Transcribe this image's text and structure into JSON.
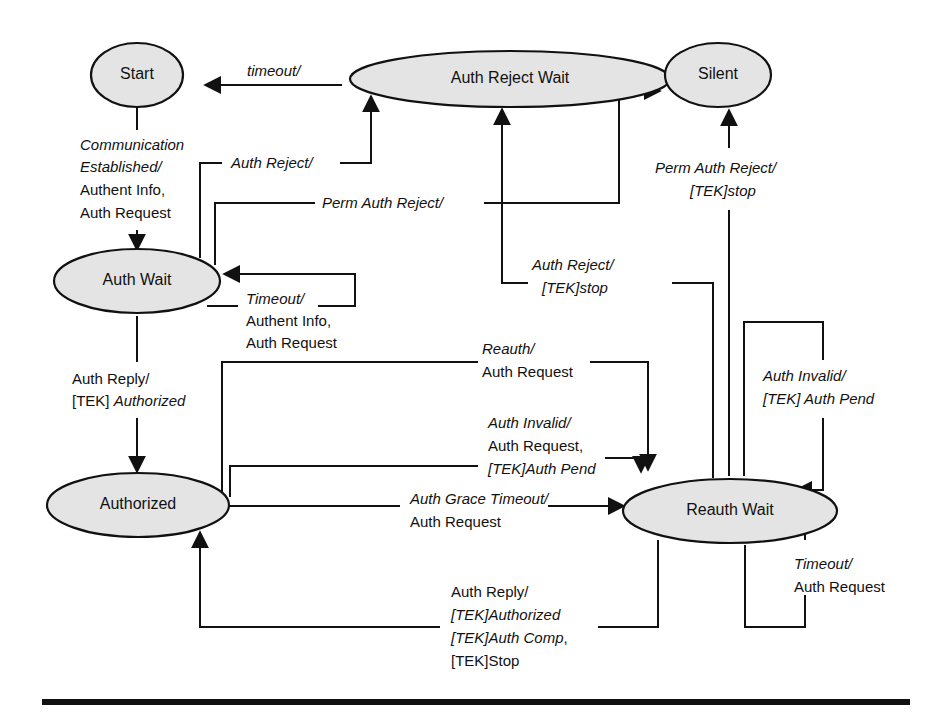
{
  "states": {
    "start": "Start",
    "auth_reject_wait": "Auth Reject Wait",
    "silent": "Silent",
    "auth_wait": "Auth Wait",
    "authorized": "Authorized",
    "reauth_wait": "Reauth Wait"
  },
  "transitions": {
    "reject_wait_to_start": {
      "line1": "timeout/"
    },
    "start_to_auth_wait": {
      "line1": "Communication",
      "line2": "Established/",
      "line3": "Authent Info,",
      "line4": "Auth Request"
    },
    "auth_wait_to_reject_wait": {
      "line1": "Auth Reject/"
    },
    "auth_wait_to_silent": {
      "line1": "Perm Auth Reject/"
    },
    "auth_wait_timeout": {
      "line1": "Timeout/",
      "line2": "Authent Info,",
      "line3": "Auth Request"
    },
    "auth_wait_to_authorized": {
      "line1": "Auth Reply/",
      "line2a": "[TEK] ",
      "line2b": "Authorized"
    },
    "reauth_to_reject_wait": {
      "line1": "Auth Reject/",
      "line2": "[TEK]stop"
    },
    "reauth_to_silent": {
      "line1": "Perm Auth Reject/",
      "line2": "[TEK]stop"
    },
    "authorized_reauth": {
      "line1": "Reauth/",
      "line2": "Auth Request"
    },
    "authorized_auth_invalid": {
      "line1": "Auth Invalid/",
      "line2": "Auth Request,",
      "line3": "[TEK]Auth Pend"
    },
    "authorized_grace_timeout": {
      "line1": "Auth Grace Timeout/",
      "line2": "Auth Request"
    },
    "reauth_to_authorized": {
      "line1": "Auth Reply/",
      "line2": "[TEK]Authorized",
      "line3": "[TEK]Auth Comp",
      "line3b": ",",
      "line4": "[TEK]Stop"
    },
    "reauth_auth_invalid": {
      "line1": "Auth Invalid/",
      "line2": "[TEK] Auth Pend"
    },
    "reauth_timeout": {
      "line1": "Timeout/",
      "line2": "Auth Request"
    }
  },
  "colors": {
    "node_fill": "#e4e4e4",
    "stroke": "#111111",
    "background": "#ffffff"
  }
}
